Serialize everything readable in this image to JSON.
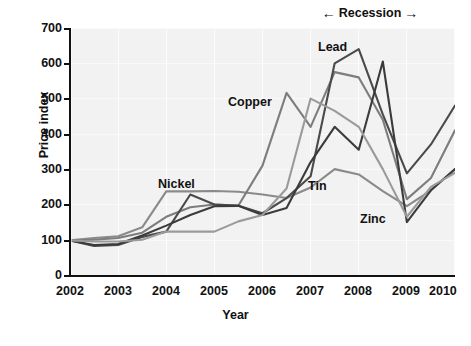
{
  "chart_data": {
    "type": "line",
    "title": "",
    "xlabel": "Year",
    "ylabel": "Price index",
    "xlim": [
      2002,
      2010
    ],
    "ylim": [
      0,
      700
    ],
    "grid": true,
    "legend_position": "inline-labels",
    "x_ticks": [
      "2002",
      "2003",
      "2004",
      "2005",
      "2006",
      "2007",
      "2008",
      "2009",
      "2010"
    ],
    "y_ticks": [
      "0",
      "100",
      "200",
      "300",
      "400",
      "500",
      "600",
      "700"
    ],
    "x": [
      2002,
      2002.5,
      2003,
      2003.5,
      2004,
      2004.5,
      2005,
      2005.5,
      2006,
      2006.5,
      2007,
      2007.5,
      2008,
      2008.5,
      2009,
      2009.5,
      2010
    ],
    "series": [
      {
        "name": "Nickel",
        "color": "#8a8a8a",
        "values": [
          98,
          105,
          110,
          135,
          237,
          237,
          238,
          236,
          228,
          218,
          248,
          300,
          285,
          238,
          195,
          240,
          300
        ]
      },
      {
        "name": "Copper",
        "color": "#7d7d7d",
        "values": [
          98,
          100,
          105,
          120,
          165,
          192,
          200,
          197,
          310,
          516,
          420,
          575,
          560,
          440,
          215,
          275,
          410
        ]
      },
      {
        "name": "Lead",
        "color": "#4a4a4a",
        "values": [
          98,
          82,
          85,
          108,
          123,
          228,
          200,
          196,
          175,
          218,
          280,
          600,
          640,
          455,
          288,
          370,
          480
        ]
      },
      {
        "name": "Tin",
        "color": "#3b3b3b",
        "values": [
          98,
          85,
          88,
          112,
          140,
          170,
          195,
          196,
          170,
          190,
          320,
          420,
          355,
          605,
          150,
          240,
          300
        ]
      },
      {
        "name": "Zinc",
        "color": "#9a9a9a",
        "values": [
          98,
          95,
          95,
          100,
          123,
          123,
          123,
          152,
          170,
          245,
          500,
          465,
          420,
          300,
          165,
          250,
          290
        ]
      }
    ],
    "annotations": [
      {
        "name": "recession-span",
        "text": "Recession",
        "left_arrow": "←",
        "right_arrow": "→",
        "x_start": 2007.75,
        "x_end": 2009.0
      }
    ],
    "series_label_positions": [
      {
        "name": "Nickel",
        "left": 158,
        "top": 178
      },
      {
        "name": "Copper",
        "left": 228,
        "top": 96
      },
      {
        "name": "Lead",
        "left": 318,
        "top": 41
      },
      {
        "name": "Tin",
        "left": 308,
        "top": 180
      },
      {
        "name": "Zinc",
        "left": 360,
        "top": 213
      }
    ]
  }
}
